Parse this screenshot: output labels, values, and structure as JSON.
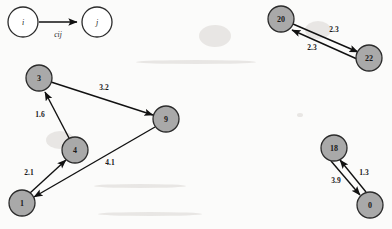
{
  "figure": {
    "type": "directed-graph-diagram",
    "background_color": "#fbfbfa",
    "node_fill": "#a9a9a9",
    "node_stroke": "#2b2b2b",
    "edge_color": "#111111",
    "width": 392,
    "height": 229
  },
  "legend": {
    "name": "edge-cost-legend",
    "source_label": "i",
    "target_label": "j",
    "edge_label": "cij",
    "source": {
      "cx": 23,
      "cy": 22,
      "r": 15
    },
    "target": {
      "cx": 97,
      "cy": 22,
      "r": 15
    }
  },
  "clusters": [
    {
      "name": "left-cluster",
      "nodes": [
        {
          "id": "3",
          "label": "3",
          "cx": 39,
          "cy": 78,
          "r": 13
        },
        {
          "id": "9",
          "label": "9",
          "cx": 166,
          "cy": 119,
          "r": 13
        },
        {
          "id": "4",
          "label": "4",
          "cx": 75,
          "cy": 150,
          "r": 13
        },
        {
          "id": "1",
          "label": "1",
          "cx": 22,
          "cy": 203,
          "r": 13
        }
      ],
      "edges": [
        {
          "from": "3",
          "to": "9",
          "label": "3.2",
          "lx": 104,
          "ly": 87
        },
        {
          "from": "4",
          "to": "3",
          "label": "1.6",
          "lx": 40,
          "ly": 114
        },
        {
          "from": "9",
          "to": "1",
          "label": "4.1",
          "lx": 110,
          "ly": 162
        },
        {
          "from": "1",
          "to": "4",
          "label": "2.1",
          "lx": 29,
          "ly": 172
        }
      ]
    },
    {
      "name": "top-right-cluster",
      "nodes": [
        {
          "id": "20",
          "label": "20",
          "cx": 281,
          "cy": 19,
          "r": 13
        },
        {
          "id": "22",
          "label": "22",
          "cx": 369,
          "cy": 58,
          "r": 13
        }
      ],
      "edges": [
        {
          "from": "20",
          "to": "22",
          "label": "2.3",
          "lx": 334,
          "ly": 29
        },
        {
          "from": "22",
          "to": "20",
          "label": "2.3",
          "lx": 312,
          "ly": 47
        }
      ]
    },
    {
      "name": "bottom-right-cluster",
      "nodes": [
        {
          "id": "18",
          "label": "18",
          "cx": 334,
          "cy": 148,
          "r": 13
        },
        {
          "id": "0",
          "label": "0",
          "cx": 370,
          "cy": 205,
          "r": 13
        }
      ],
      "edges": [
        {
          "from": "18",
          "to": "0",
          "label": "3.9",
          "lx": 336,
          "ly": 180
        },
        {
          "from": "0",
          "to": "18",
          "label": "1.3",
          "lx": 364,
          "ly": 172
        }
      ]
    }
  ]
}
